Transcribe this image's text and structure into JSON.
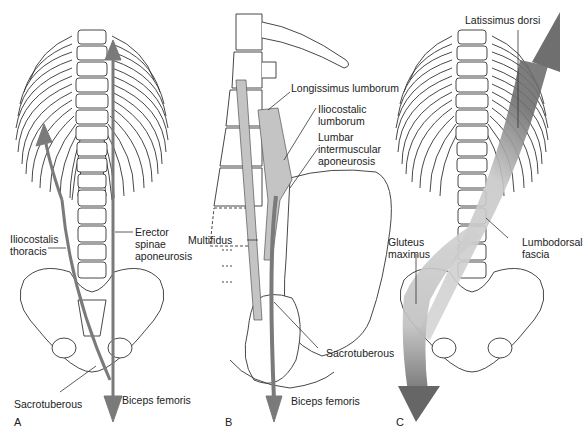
{
  "figure": {
    "panels": [
      {
        "letter": "A",
        "labels": {
          "iliocostalis": [
            "Iliocostalis",
            "thoracis"
          ],
          "erector": [
            "Erector",
            "spinae",
            "aponeurosis"
          ],
          "sacrotuberous": "Sacrotuberous",
          "biceps": "Biceps femoris"
        }
      },
      {
        "letter": "B",
        "labels": {
          "longissimus": "Longissimus lumborum",
          "iliocostalis": [
            "Iliocostalic",
            "lumborum"
          ],
          "lumbar": [
            "Lumbar",
            "intermuscular",
            "aponeurosis"
          ],
          "multifidus": "Multifidus",
          "sacrotuberous": "Sacrotuberous",
          "biceps": "Biceps femoris"
        }
      },
      {
        "letter": "C",
        "labels": {
          "latissimus": "Latissimus dorsi",
          "gluteus": [
            "Gluteus",
            "maximus"
          ],
          "lumbodorsal": [
            "Lumbodorsal",
            "fascia"
          ]
        }
      }
    ],
    "colors": {
      "arrow": "#7a7a7a",
      "muscle": "#c4c4c4",
      "bone_stroke": "#333333"
    }
  }
}
